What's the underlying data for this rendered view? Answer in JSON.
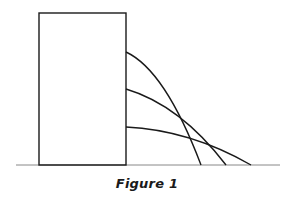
{
  "figure": {
    "caption": "Figure 1",
    "stroke_color": "#1a1a1a",
    "ground_color": "#888888",
    "ground": {
      "x1": 16,
      "x2": 280,
      "y": 165
    },
    "tank": {
      "x": 39,
      "y": 13,
      "width": 87,
      "height": 152
    },
    "jets": [
      {
        "name": "top-jet",
        "start": [
          126,
          52
        ],
        "control": [
          165,
          70
        ],
        "end": [
          201,
          165
        ]
      },
      {
        "name": "middle-jet",
        "start": [
          126,
          89
        ],
        "control": [
          180,
          105
        ],
        "end": [
          226,
          165
        ]
      },
      {
        "name": "bottom-jet",
        "start": [
          126,
          127
        ],
        "control": [
          190,
          130
        ],
        "end": [
          251,
          165
        ]
      }
    ]
  }
}
